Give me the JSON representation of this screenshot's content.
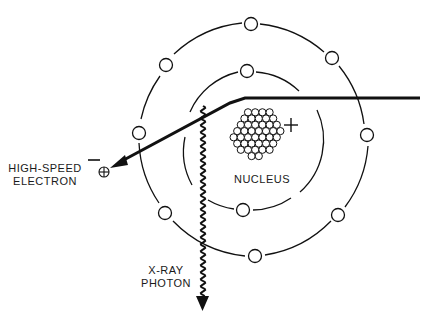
{
  "diagram": {
    "type": "bremsstrahlung-xray-production",
    "labels": {
      "electron_line1": "HIGH-SPEED",
      "electron_line2": "ELECTRON",
      "nucleus": "NUCLEUS",
      "photon_line1": "X-RAY",
      "photon_line2": "PHOTON",
      "electron_charge": "−",
      "nucleus_charge": "+"
    },
    "colors": {
      "stroke": "#111111",
      "background": "#ffffff"
    },
    "orbits": [
      {
        "name": "inner",
        "cx": 250,
        "cy": 140,
        "r": 70,
        "electrons": [
          [
            247,
            71
          ],
          [
            243,
            210
          ]
        ]
      },
      {
        "name": "outer",
        "cx": 252,
        "cy": 139,
        "r": 117,
        "electrons": [
          [
            166,
            65
          ],
          [
            251,
            24
          ],
          [
            332,
            58
          ],
          [
            367,
            135
          ],
          [
            338,
            215
          ],
          [
            255,
            256
          ],
          [
            165,
            213
          ],
          [
            139,
            133
          ]
        ]
      }
    ]
  }
}
